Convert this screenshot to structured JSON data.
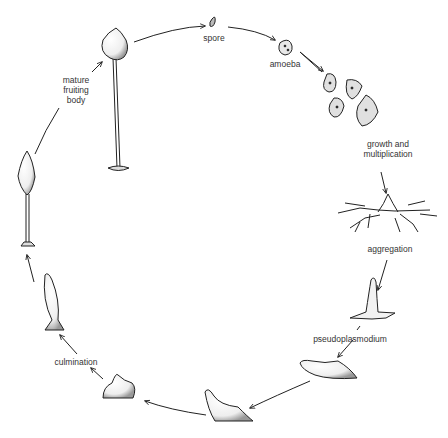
{
  "diagram": {
    "type": "life-cycle",
    "stages": [
      {
        "id": "spore",
        "label": "spore"
      },
      {
        "id": "amoeba",
        "label": "amoeba"
      },
      {
        "id": "growth",
        "label": "growth and\nmultiplication"
      },
      {
        "id": "aggregation",
        "label": "aggregation"
      },
      {
        "id": "pseudoplasmodium",
        "label": "pseudoplasmodium"
      },
      {
        "id": "migrating-slug-1",
        "label": ""
      },
      {
        "id": "migrating-slug-2",
        "label": ""
      },
      {
        "id": "culmination",
        "label": "culmination"
      },
      {
        "id": "elongating-stalk",
        "label": ""
      },
      {
        "id": "early-fruiting-body",
        "label": ""
      },
      {
        "id": "mature-fruiting-body",
        "label": "mature\nfruiting\nbody"
      }
    ]
  }
}
